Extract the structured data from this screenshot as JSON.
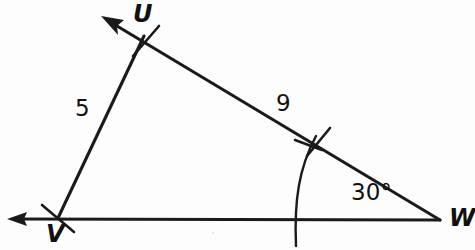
{
  "figure": {
    "type": "triangle-diagram",
    "background_color": "#fdfdfd",
    "stroke_color": "#1a1a1a"
  },
  "vertices": [
    {
      "id": "U",
      "label": "U",
      "x": 143,
      "y": 40
    },
    {
      "id": "V",
      "label": "V",
      "x": 58,
      "y": 218
    },
    {
      "id": "W",
      "label": "W",
      "x": 440,
      "y": 220
    }
  ],
  "sides": [
    {
      "id": "UV",
      "label": "5",
      "from": "V",
      "to": "U",
      "has_tick": true
    },
    {
      "id": "UW",
      "label": "9",
      "from": "U",
      "to": "W",
      "has_tick": true
    },
    {
      "id": "VW",
      "label": "",
      "from": "V",
      "to": "W",
      "has_tick": false
    }
  ],
  "angles": [
    {
      "id": "W",
      "label": "30°",
      "vertex": "W",
      "has_arc": true
    }
  ],
  "rays": [
    {
      "id": "ray-WU",
      "direction": "up-left",
      "through": "U",
      "arrowhead": true
    },
    {
      "id": "ray-WV",
      "direction": "left",
      "through": "V",
      "arrowhead": true
    }
  ]
}
